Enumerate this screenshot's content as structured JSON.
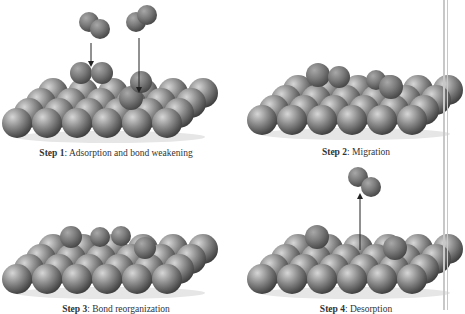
{
  "figure": {
    "panels": [
      {
        "id": "step1",
        "step_label": "Step 1",
        "caption": "Adsorption and bond weakening",
        "origin": [
          17,
          123
        ],
        "caption_pos": [
          116,
          157
        ],
        "adsorbates": [
          {
            "type": "molecule",
            "atoms": [
              [
                89,
                22
              ],
              [
                100,
                29
              ]
            ],
            "r": 10
          },
          {
            "type": "molecule",
            "atoms": [
              [
                136,
                22
              ],
              [
                147,
                15
              ]
            ],
            "r": 10
          },
          {
            "type": "molecule",
            "atoms": [
              [
                81,
                73
              ],
              [
                102,
                73
              ]
            ],
            "r": 11
          },
          {
            "type": "atom",
            "at": [
              131,
              98
            ],
            "r": 12
          },
          {
            "type": "atom",
            "at": [
              141,
              82
            ],
            "r": 11
          }
        ],
        "arrows": [
          {
            "from": [
              91,
              43
            ],
            "to": [
              91,
              64
            ]
          },
          {
            "from": [
              139,
              38
            ],
            "to": [
              139,
              90
            ]
          }
        ]
      },
      {
        "id": "step2",
        "step_label": "Step 2",
        "caption": "Migration",
        "origin": [
          262,
          120
        ],
        "caption_pos": [
          356,
          156
        ],
        "adsorbates": [
          {
            "type": "atom",
            "at": [
              318,
              75
            ],
            "r": 12
          },
          {
            "type": "atom",
            "at": [
              339,
              77
            ],
            "r": 11
          },
          {
            "type": "atom",
            "at": [
              376,
              80
            ],
            "r": 10
          },
          {
            "type": "atom",
            "at": [
              391,
              87
            ],
            "r": 12
          }
        ],
        "arrows": []
      },
      {
        "id": "step3",
        "step_label": "Step 3",
        "caption": "Bond reorganization",
        "origin": [
          17,
          279
        ],
        "caption_pos": [
          116,
          313
        ],
        "adsorbates": [
          {
            "type": "atom",
            "at": [
              71,
              237
            ],
            "r": 11
          },
          {
            "type": "atom",
            "at": [
              100,
              237
            ],
            "r": 10
          },
          {
            "type": "atom",
            "at": [
              121,
              236
            ],
            "r": 10
          },
          {
            "type": "atom",
            "at": [
              145,
              248
            ],
            "r": 11
          }
        ],
        "arrows": []
      },
      {
        "id": "step4",
        "step_label": "Step 4",
        "caption": "Desorption",
        "origin": [
          262,
          279
        ],
        "caption_pos": [
          356,
          313
        ],
        "adsorbates": [
          {
            "type": "molecule",
            "atoms": [
              [
                358,
                177
              ],
              [
                371,
                187
              ]
            ],
            "r": 10
          },
          {
            "type": "atom",
            "at": [
              317,
              237
            ],
            "r": 12
          },
          {
            "type": "atom",
            "at": [
              395,
              248
            ],
            "r": 12
          }
        ],
        "arrows": [
          {
            "from": [
              360,
              250
            ],
            "to": [
              360,
              196
            ]
          }
        ]
      }
    ],
    "grid": {
      "cols": 6,
      "rows": 4,
      "spacing_x": 30,
      "row_dx": 12,
      "row_dy": -10,
      "atom_r": 15
    },
    "colors": {
      "atom_light": "#c9c9c9",
      "atom_mid": "#8a8a8a",
      "atom_dark": "#3e3e3e",
      "adsorbate_mid": "#7a7a7a",
      "arrow": "#222222",
      "caption": "#333333",
      "edge_line": "#c8c8c8"
    }
  }
}
